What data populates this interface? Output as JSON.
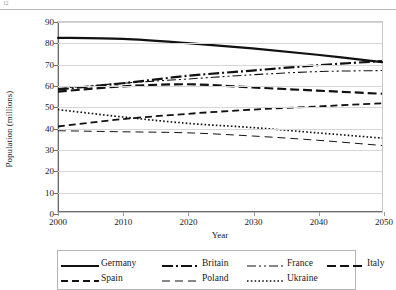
{
  "page": {
    "corner_mark": "12",
    "chart_title": ""
  },
  "axes": {
    "ylabel": "Population (millions)",
    "xlabel": "Year",
    "yticks": [
      0,
      10,
      20,
      30,
      40,
      50,
      60,
      70,
      80,
      90
    ],
    "xticks": [
      2000,
      2010,
      2020,
      2030,
      2040,
      2050
    ]
  },
  "legend": {
    "rows": [
      [
        {
          "name": "Germany",
          "style": "solid-thick"
        },
        {
          "name": "Britain",
          "style": "dashdot-thick"
        },
        {
          "name": "France",
          "style": "dashdotdot-thin"
        },
        {
          "name": "Italy",
          "style": "dashed-thick"
        }
      ],
      [
        {
          "name": "Spain",
          "style": "dashed-medium"
        },
        {
          "name": "Poland",
          "style": "longdash-thin"
        },
        {
          "name": "Ukraine",
          "style": "dotted-medium"
        }
      ]
    ]
  },
  "chart_data": {
    "type": "line",
    "title": "",
    "xlabel": "Year",
    "ylabel": "Population (millions)",
    "xlim": [
      2000,
      2050
    ],
    "ylim": [
      0,
      90
    ],
    "ytick_step": 10,
    "grid": true,
    "legend_position": "bottom",
    "x": [
      2000,
      2010,
      2020,
      2030,
      2040,
      2050
    ],
    "series": [
      {
        "name": "Germany",
        "style": "solid-thick",
        "values": [
          82.5,
          82.0,
          80.0,
          77.5,
          74.5,
          71.0
        ]
      },
      {
        "name": "Britain",
        "style": "dashdot-thick",
        "values": [
          58.0,
          61.0,
          64.5,
          67.0,
          69.5,
          71.5
        ]
      },
      {
        "name": "France",
        "style": "dashdotdot-thin",
        "values": [
          58.5,
          61.0,
          63.0,
          65.0,
          66.5,
          67.0
        ]
      },
      {
        "name": "Italy",
        "style": "dashed-thick",
        "values": [
          57.0,
          59.5,
          60.5,
          59.0,
          57.5,
          56.0
        ]
      },
      {
        "name": "Spain",
        "style": "dashed-medium",
        "values": [
          40.5,
          44.0,
          46.5,
          48.5,
          50.0,
          51.5
        ]
      },
      {
        "name": "Poland",
        "style": "longdash-thin",
        "values": [
          38.5,
          38.0,
          37.5,
          36.0,
          34.0,
          31.5
        ]
      },
      {
        "name": "Ukraine",
        "style": "dotted-medium",
        "values": [
          48.5,
          45.0,
          42.0,
          40.0,
          37.5,
          35.0
        ]
      }
    ]
  }
}
